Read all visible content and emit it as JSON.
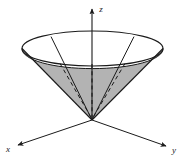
{
  "figure": {
    "background_color": "#ffffff",
    "stroke_color": "#1a1a1a",
    "shade_color": "#b3b3b3",
    "width": 184,
    "height": 163
  },
  "axes": {
    "origin": {
      "x": 92,
      "y": 120
    },
    "items": [
      {
        "name": "z",
        "label": "z",
        "label_x": 101,
        "label_y": 12,
        "tip_x": 92,
        "tip_y": 6,
        "arrow": true,
        "direction": "up"
      },
      {
        "name": "x",
        "label": "x",
        "label_x": 8,
        "label_y": 151,
        "tip_x": 16,
        "tip_y": 146,
        "arrow": true,
        "direction": "lower-left"
      },
      {
        "name": "y",
        "label": "y",
        "label_x": 172,
        "label_y": 152,
        "tip_x": 168,
        "tip_y": 147,
        "arrow": true,
        "direction": "lower-right"
      }
    ]
  },
  "cone": {
    "apex": {
      "x": 92,
      "y": 120
    },
    "rim_center": {
      "x": 92.5,
      "y": 48.5
    },
    "rim_radius_x": 70.5,
    "rim_radius_y": 17.5,
    "rim_top_y": 31,
    "rim_bottom_y": 66,
    "rim_left_x": 22,
    "rim_right_x": 163,
    "shaded_fill": "#b3b3b3",
    "shaded_region_label": "interior solid region",
    "generator_lines": [
      {
        "name": "generator-left-outer",
        "from_x": 22,
        "from_y": 48.5,
        "to_x": 92,
        "to_y": 120,
        "style": "solid"
      },
      {
        "name": "generator-right-outer",
        "from_x": 163,
        "from_y": 48.5,
        "to_x": 92,
        "to_y": 120,
        "style": "solid"
      },
      {
        "name": "generator-left-front",
        "from_x": 51,
        "from_y": 36.5,
        "to_x": 92,
        "to_y": 120,
        "style": "solid"
      },
      {
        "name": "generator-right-front",
        "from_x": 134,
        "from_y": 36.5,
        "to_x": 92,
        "to_y": 120,
        "style": "solid"
      },
      {
        "name": "generator-left-hidden",
        "from_x": 57,
        "from_y": 62,
        "to_x": 92,
        "to_y": 120,
        "style": "dashed"
      },
      {
        "name": "generator-right-hidden",
        "from_x": 128,
        "from_y": 62,
        "to_x": 92,
        "to_y": 120,
        "style": "dashed"
      }
    ],
    "hidden_axis_segment": {
      "name": "z-axis-hidden",
      "from_x": 92,
      "from_y": 63,
      "to_x": 92,
      "to_y": 120,
      "style": "dashed"
    }
  }
}
